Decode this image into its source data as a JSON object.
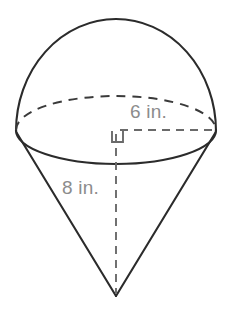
{
  "figure": {
    "name": "cone-with-hemisphere-diagram",
    "background_color": "#ffffff",
    "stroke_color": "#2b2b2b",
    "dashed_stroke_color": "#3a3a3a",
    "label_color": "#8c8c8c",
    "labels": {
      "radius": "6 in.",
      "height": "8 in."
    },
    "geometry": {
      "ellipse_center_x": 116,
      "ellipse_center_y": 130,
      "ellipse_rx": 100,
      "ellipse_ry": 35,
      "dome_apex_y": 21,
      "cone_apex_x": 116,
      "cone_apex_y": 296,
      "rim_left_x": 16,
      "rim_right_x": 216,
      "rim_y": 133
    },
    "icons": {
      "right_angle": "right-angle-marker-icon"
    }
  }
}
